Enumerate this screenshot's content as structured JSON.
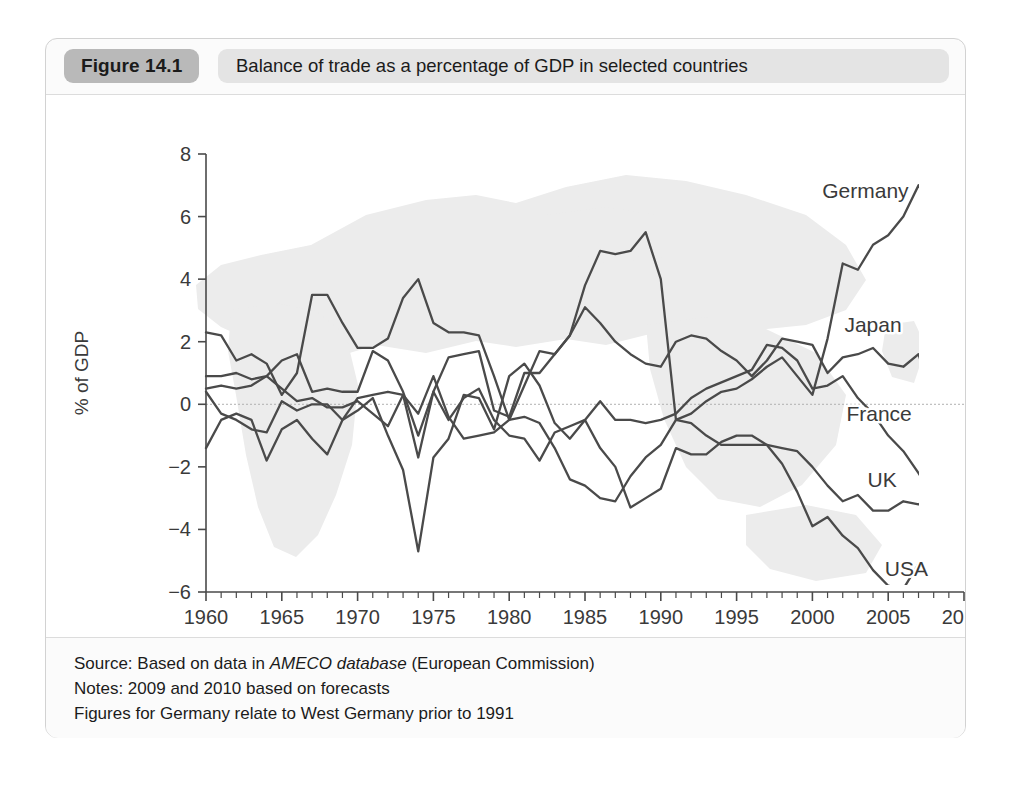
{
  "figure": {
    "number_label": "Figure 14.1",
    "title": "Balance of trade as a percentage of GDP in selected countries"
  },
  "notes": {
    "source_prefix": "Source: Based on data in ",
    "source_em": "AMECO database",
    "source_suffix": " (European Commission)",
    "note_forecast": "Notes: 2009 and 2010 based on forecasts",
    "note_germany": "Figures for Germany relate to West Germany prior to 1991"
  },
  "colors": {
    "line": "#4a4a4a",
    "axis": "#4a4a4a",
    "watermark": "#ececec",
    "number_pill": "#b9b9b9",
    "title_pill": "#e4e4e4",
    "card_bg": "#fbfbfb",
    "plot_bg": "#ffffff"
  },
  "chart_data": {
    "type": "line",
    "title": "Balance of trade as a percentage of GDP in selected countries",
    "xlabel": "",
    "ylabel": "% of GDP",
    "xlim": [
      1960,
      2010
    ],
    "ylim": [
      -6,
      8
    ],
    "yticks": [
      -6,
      -4,
      -2,
      0,
      2,
      4,
      6,
      8
    ],
    "ytick_labels": [
      "−6",
      "−4",
      "−2",
      "0",
      "2",
      "4",
      "6",
      "8"
    ],
    "xticks": [
      1960,
      1965,
      1970,
      1975,
      1980,
      1985,
      1990,
      1995,
      2000,
      2005,
      2010
    ],
    "xtick_labels": [
      "1960",
      "1965",
      "1970",
      "1975",
      "1980",
      "1985",
      "1990",
      "1995",
      "2000",
      "2005",
      "2010"
    ],
    "x_minor_tick_step": 1,
    "grid": false,
    "zero_reference_line": true,
    "legend": "inline-labels-right",
    "x": [
      1960,
      1961,
      1962,
      1963,
      1964,
      1965,
      1966,
      1967,
      1968,
      1969,
      1970,
      1971,
      1972,
      1973,
      1974,
      1975,
      1976,
      1977,
      1978,
      1979,
      1980,
      1981,
      1982,
      1983,
      1984,
      1985,
      1986,
      1987,
      1988,
      1989,
      1990,
      1991,
      1992,
      1993,
      1994,
      1995,
      1996,
      1997,
      1998,
      1999,
      2000,
      2001,
      2002,
      2003,
      2004,
      2005,
      2006,
      2007,
      2008,
      2009,
      2010
    ],
    "series": [
      {
        "name": "Germany",
        "label": "Germany",
        "label_year": 2003.5,
        "label_value": 6.6,
        "values": [
          2.3,
          2.2,
          1.4,
          1.6,
          1.3,
          0.3,
          1.0,
          3.5,
          3.5,
          2.6,
          1.8,
          1.8,
          2.1,
          3.4,
          4.0,
          2.6,
          2.3,
          2.3,
          2.2,
          0.9,
          -0.5,
          0.6,
          1.7,
          1.6,
          2.2,
          3.8,
          4.9,
          4.8,
          4.9,
          5.5,
          4.0,
          -0.5,
          -0.3,
          0.1,
          0.4,
          0.5,
          0.8,
          1.2,
          1.5,
          0.9,
          0.3,
          2.1,
          4.5,
          4.3,
          5.1,
          5.4,
          6.0,
          7.0,
          6.2,
          3.4,
          3.6
        ]
      },
      {
        "name": "Japan",
        "label": "Japan",
        "label_year": 2004.0,
        "label_value": 2.3,
        "values": [
          0.9,
          0.9,
          1.0,
          0.8,
          0.9,
          1.4,
          1.6,
          0.4,
          0.5,
          0.4,
          0.4,
          1.7,
          1.4,
          0.4,
          -1.0,
          0.4,
          1.5,
          1.6,
          1.7,
          -0.2,
          -0.4,
          1.0,
          1.0,
          1.6,
          2.2,
          3.1,
          2.6,
          2.0,
          1.6,
          1.3,
          1.2,
          2.0,
          2.2,
          2.1,
          1.7,
          1.4,
          0.9,
          1.4,
          2.1,
          2.0,
          1.9,
          1.0,
          1.5,
          1.6,
          1.8,
          1.3,
          1.2,
          1.6,
          0.1,
          1.1,
          1.5
        ]
      },
      {
        "name": "France",
        "label": "France",
        "label_year": 2004.4,
        "label_value": -0.55,
        "values": [
          0.4,
          -0.3,
          -0.5,
          -0.8,
          -0.9,
          0.1,
          -0.2,
          0.0,
          0.0,
          -0.5,
          0.2,
          0.3,
          0.4,
          0.3,
          -1.7,
          0.4,
          -0.5,
          0.2,
          0.5,
          -0.5,
          -1.0,
          -1.1,
          -1.8,
          -0.9,
          -0.7,
          -0.5,
          0.1,
          -0.5,
          -0.5,
          -0.6,
          -0.5,
          -0.3,
          0.2,
          0.5,
          0.7,
          0.9,
          1.1,
          1.9,
          1.8,
          1.4,
          0.5,
          0.6,
          0.9,
          0.2,
          -0.3,
          -1.0,
          -1.5,
          -2.2,
          -3.0,
          -3.3,
          -3.5
        ]
      },
      {
        "name": "UK",
        "label": "UK",
        "label_year": 2004.6,
        "label_value": -2.65,
        "values": [
          -1.4,
          -0.5,
          -0.3,
          -0.5,
          -1.8,
          -0.8,
          -0.5,
          -1.1,
          -1.6,
          -0.5,
          -0.2,
          0.2,
          -1.0,
          -2.1,
          -4.7,
          -1.7,
          -1.1,
          0.3,
          0.2,
          -0.8,
          0.9,
          1.3,
          0.6,
          -0.6,
          -1.1,
          -0.5,
          -1.4,
          -2.0,
          -3.3,
          -3.0,
          -2.7,
          -1.4,
          -1.6,
          -1.6,
          -1.2,
          -1.0,
          -1.0,
          -1.3,
          -1.4,
          -1.5,
          -2.0,
          -2.6,
          -3.1,
          -2.9,
          -3.4,
          -3.4,
          -3.1,
          -3.2,
          -2.9,
          -2.8,
          -2.7
        ]
      },
      {
        "name": "USA",
        "label": "USA",
        "label_year": 2006.2,
        "label_value": -5.5,
        "values": [
          0.5,
          0.6,
          0.5,
          0.6,
          0.9,
          0.5,
          0.1,
          0.2,
          -0.1,
          -0.1,
          0.1,
          -0.3,
          -0.7,
          0.3,
          -0.3,
          0.9,
          -0.4,
          -1.1,
          -1.0,
          -0.9,
          -0.5,
          -0.4,
          -0.6,
          -1.4,
          -2.4,
          -2.6,
          -3.0,
          -3.1,
          -2.3,
          -1.7,
          -1.3,
          -0.5,
          -0.6,
          -1.0,
          -1.3,
          -1.3,
          -1.3,
          -1.3,
          -1.9,
          -2.8,
          -3.9,
          -3.6,
          -4.2,
          -4.6,
          -5.3,
          -5.8,
          -5.9,
          -5.1,
          -4.4,
          -4.2,
          -3.9
        ]
      }
    ]
  }
}
